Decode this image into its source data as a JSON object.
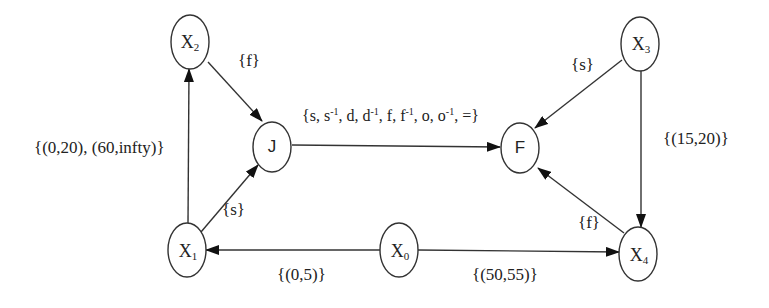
{
  "diagram": {
    "nodes": [
      {
        "id": "X0",
        "label": "X",
        "sub": "0"
      },
      {
        "id": "X1",
        "label": "X",
        "sub": "1"
      },
      {
        "id": "X2",
        "label": "X",
        "sub": "2"
      },
      {
        "id": "X3",
        "label": "X",
        "sub": "3"
      },
      {
        "id": "X4",
        "label": "X",
        "sub": "4"
      },
      {
        "id": "J",
        "label": "J"
      },
      {
        "id": "F",
        "label": "F"
      }
    ],
    "edges": [
      {
        "from": "X1",
        "to": "X2",
        "label": "{(0,20), (60,infty)}"
      },
      {
        "from": "X2",
        "to": "J",
        "label": "{f}"
      },
      {
        "from": "X1",
        "to": "J",
        "label": "{s}"
      },
      {
        "from": "J",
        "to": "F",
        "label_parts": [
          "{s, s",
          "-1",
          ", d, d",
          "-1",
          ", f, f",
          "-1",
          ", o, o",
          "-1",
          ", =}"
        ]
      },
      {
        "from": "X3",
        "to": "F",
        "label": "{s}"
      },
      {
        "from": "X3",
        "to": "X4",
        "label": "{(15,20)}"
      },
      {
        "from": "X4",
        "to": "F",
        "label": "{f}"
      },
      {
        "from": "X0",
        "to": "X1",
        "label": "{(0,5)}"
      },
      {
        "from": "X0",
        "to": "X4",
        "label": "{(50,55)}"
      }
    ]
  }
}
